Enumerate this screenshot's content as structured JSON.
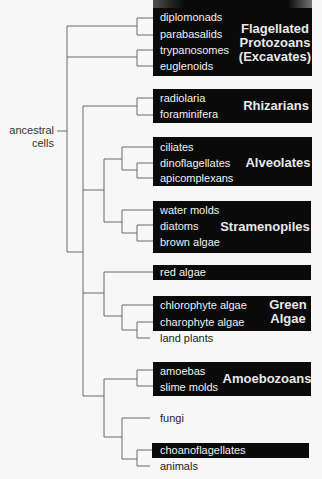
{
  "root_label": {
    "line1": "ancestral",
    "line2": "cells"
  },
  "groups": [
    {
      "name": "Flagellated Protozoans (Excavates)",
      "lines": [
        "Flagellated",
        "Protozoans",
        "(Excavates)"
      ],
      "members": [
        "diplomonads",
        "parabasalids",
        "trypanosomes",
        "euglenoids"
      ]
    },
    {
      "name": "Rhizarians",
      "lines": [
        "Rhizarians"
      ],
      "members": [
        "radiolaria",
        "foraminifera"
      ]
    },
    {
      "name": "Alveolates",
      "lines": [
        "Alveolates"
      ],
      "members": [
        "ciliates",
        "dinoflagellates",
        "apicomplexans"
      ]
    },
    {
      "name": "Stramenopiles",
      "lines": [
        "Stramenopiles"
      ],
      "members": [
        "water molds",
        "diatoms",
        "brown algae"
      ]
    },
    {
      "name": "red algae",
      "lines": [],
      "members": [
        "red algae"
      ]
    },
    {
      "name": "Green Algae",
      "lines": [
        "Green",
        "Algae"
      ],
      "members": [
        "chlorophyte algae",
        "charophyte algae"
      ]
    },
    {
      "name": "Amoebozoans",
      "lines": [
        "Amoebozoans"
      ],
      "members": [
        "amoebas",
        "slime molds"
      ]
    },
    {
      "name": "choanoflagellates",
      "lines": [],
      "members": [
        "choanoflagellates"
      ]
    }
  ],
  "unboxed_taxa": [
    "land plants",
    "fungi",
    "animals"
  ],
  "colors": {
    "box": "#0a0a0a",
    "box_text": "#f0f0f0",
    "line": "#666666",
    "background": "#f7f7f7"
  }
}
